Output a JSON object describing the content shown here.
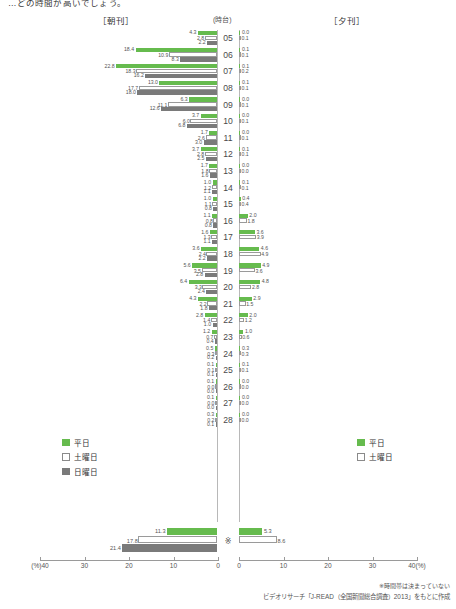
{
  "headline": "…どの時間が高いでしょう。",
  "captions": {
    "morning": "［朝刊］",
    "hour_unit": "(時台)",
    "evening": "［夕刊］"
  },
  "legend_morning": {
    "items": [
      {
        "label": "平日",
        "key": "weekday",
        "color": "#66bb4e"
      },
      {
        "label": "土曜日",
        "key": "saturday",
        "color": "#ffffff"
      },
      {
        "label": "日曜日",
        "key": "sunday",
        "color": "#7a7a7a"
      }
    ]
  },
  "legend_evening": {
    "items": [
      {
        "label": "平日",
        "key": "weekday",
        "color": "#66bb4e"
      },
      {
        "label": "土曜日",
        "key": "saturday",
        "color": "#ffffff"
      }
    ]
  },
  "axis": {
    "left_ticks": [
      "(%)40",
      "30",
      "20",
      "10",
      "0"
    ],
    "right_ticks": [
      "0",
      "10",
      "20",
      "30",
      "40(%)"
    ],
    "max": 40
  },
  "summary_mark": "※",
  "notes": {
    "asterisk": "※時間帯は決まっていない",
    "source": "ビデオリサーチ「J-READ（全国新聞総合調査）2013」をもとに作成"
  },
  "chart_data": {
    "type": "bar",
    "orientation": "horizontal-diverging",
    "xlabel": "(%)",
    "ylabel": "時台",
    "xlim": [
      0,
      40
    ],
    "categories": [
      "05",
      "06",
      "07",
      "08",
      "09",
      "10",
      "11",
      "12",
      "13",
      "14",
      "15",
      "16",
      "17",
      "18",
      "19",
      "20",
      "21",
      "22",
      "23",
      "24",
      "25",
      "26",
      "27",
      "28"
    ],
    "panels": [
      {
        "name": "朝刊",
        "direction": "left",
        "series": [
          {
            "name": "平日",
            "key": "weekday",
            "values": [
              4.3,
              18.4,
              22.8,
              13.0,
              6.3,
              3.7,
              1.7,
              3.7,
              1.7,
              1.0,
              1.0,
              1.1,
              1.6,
              3.6,
              5.6,
              6.4,
              4.3,
              2.8,
              1.2,
              0.5,
              0.1,
              0.1,
              0.1,
              0.3
            ]
          },
          {
            "name": "土曜日",
            "key": "saturday",
            "values": [
              2.8,
              10.9,
              18.3,
              17.7,
              11.1,
              6.0,
              2.6,
              2.8,
              1.8,
              1.2,
              1.1,
              0.8,
              1.3,
              2.4,
              3.5,
              3.3,
              2.2,
              1.4,
              0.7,
              0.3,
              0.1,
              0.0,
              0.0,
              0.2
            ]
          },
          {
            "name": "日曜日",
            "key": "sunday",
            "values": [
              2.2,
              8.3,
              16.2,
              18.0,
              12.6,
              6.8,
              3.0,
              2.5,
              1.6,
              1.1,
              0.8,
              0.8,
              1.1,
              2.2,
              2.8,
              2.4,
              1.8,
              1.0,
              0.4,
              0.2,
              0.1,
              0.0,
              0.0,
              0.1
            ]
          }
        ]
      },
      {
        "name": "夕刊",
        "direction": "right",
        "series": [
          {
            "name": "平日",
            "key": "weekday",
            "values": [
              0.0,
              0.1,
              0.1,
              0.1,
              0.0,
              0.0,
              0.0,
              0.1,
              0.0,
              0.1,
              0.4,
              2.0,
              3.6,
              4.6,
              4.9,
              4.8,
              2.9,
              2.0,
              1.0,
              0.3,
              0.1,
              0.0,
              0.0,
              0.0
            ]
          },
          {
            "name": "土曜日",
            "key": "saturday",
            "values": [
              0.1,
              0.1,
              0.2,
              0.1,
              0.1,
              0.1,
              0.1,
              0.1,
              0.0,
              0.1,
              0.4,
              1.8,
              3.9,
              4.9,
              3.6,
              2.8,
              1.5,
              1.2,
              0.6,
              0.3,
              0.1,
              0.0,
              0.0,
              0.0
            ]
          }
        ]
      }
    ],
    "summary_row": {
      "label": "※",
      "morning": [
        {
          "name": "平日",
          "key": "weekday",
          "value": 11.3
        },
        {
          "name": "土曜日",
          "key": "saturday",
          "value": 17.8
        },
        {
          "name": "日曜日",
          "key": "sunday",
          "value": 21.4
        }
      ],
      "evening": [
        {
          "name": "平日",
          "key": "weekday",
          "value": 5.3
        },
        {
          "name": "土曜日",
          "key": "saturday",
          "value": 8.6
        }
      ]
    }
  }
}
